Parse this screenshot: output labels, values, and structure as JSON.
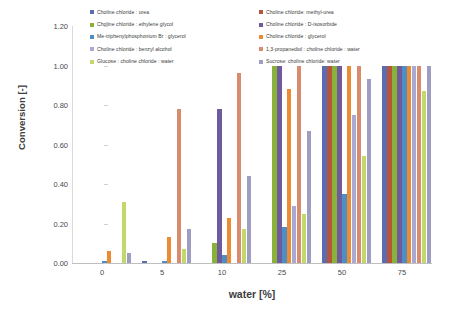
{
  "chart_data": {
    "type": "bar",
    "title": "",
    "xlabel": "water [%]",
    "ylabel": "Conversion [-]",
    "categories": [
      "0",
      "5",
      "10",
      "25",
      "50",
      "75"
    ],
    "ylim": [
      0.0,
      1.2
    ],
    "yticks": [
      "0.00",
      "0.20",
      "0.40",
      "0.60",
      "0.80",
      "1.00",
      "1.20"
    ],
    "grid": false,
    "legend_position": "top",
    "series": [
      {
        "name": "Choline chloride : urea",
        "color": "#5b6cb0",
        "values": [
          0.0,
          0.01,
          0.0,
          0.0,
          1.0,
          1.0
        ]
      },
      {
        "name": "Choline chloride: methyl-urea",
        "color": "#b5563c",
        "values": [
          0.0,
          0.0,
          0.0,
          0.0,
          1.0,
          1.0
        ]
      },
      {
        "name": "Choline chloride : ethylene glycol",
        "color": "#8ab23a",
        "values": [
          0.0,
          0.0,
          0.1,
          1.0,
          1.0,
          1.0
        ]
      },
      {
        "name": "Choline chloride : D-isosorbide",
        "color": "#6f5a9e",
        "values": [
          0.0,
          0.0,
          0.78,
          1.0,
          1.0,
          1.0
        ]
      },
      {
        "name": "Me-triphenylphosphonium Br : glycerol",
        "color": "#4d8ec4",
        "values": [
          0.01,
          0.01,
          0.04,
          0.18,
          0.35,
          1.0
        ]
      },
      {
        "name": "Choline chloride : glycerol",
        "color": "#ec8c32",
        "values": [
          0.06,
          0.13,
          0.23,
          0.88,
          1.0,
          1.0
        ]
      },
      {
        "name": "Choline chloride : benzyl alcohol",
        "color": "#a8a9d4",
        "values": [
          0.0,
          0.0,
          0.0,
          0.29,
          0.75,
          1.0
        ]
      },
      {
        "name": "1,3-propanediol : choline chloride : water",
        "color": "#d98b6e",
        "values": [
          0.0,
          0.78,
          0.96,
          1.0,
          1.0,
          1.0
        ]
      },
      {
        "name": "Glucose : choline chloride : water",
        "color": "#c3d86a",
        "values": [
          0.31,
          0.07,
          0.17,
          0.25,
          0.54,
          0.87
        ]
      },
      {
        "name": "Sucrose: choline chloride: water",
        "color": "#9d9ec0",
        "values": [
          0.05,
          0.17,
          0.44,
          0.67,
          0.93,
          1.0
        ]
      }
    ]
  }
}
